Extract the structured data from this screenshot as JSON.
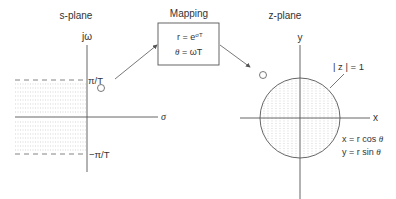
{
  "s_plane": {
    "title": "s-plane",
    "vertical_axis_label": "jω",
    "horizontal_axis_label": "σ",
    "upper_limit_label": "π/T",
    "lower_limit_label": "−π/T",
    "shaded_region": "left half-plane strip between −π/T and π/T"
  },
  "mapping": {
    "title": "Mapping",
    "line1": "r = e",
    "line1_exponent": "σT",
    "line2_lhs": "θ",
    "line2_rhs": " = ωT"
  },
  "z_plane": {
    "title": "z-plane",
    "vertical_axis_label": "y",
    "horizontal_axis_label": "x",
    "unit_circle_label": "| z | = 1",
    "eq_x": "x = r cos ",
    "eq_y": "y = r sin ",
    "theta": "θ"
  },
  "colors": {
    "line": "#555555",
    "text": "#333333",
    "shading": "#bbbbbb"
  }
}
